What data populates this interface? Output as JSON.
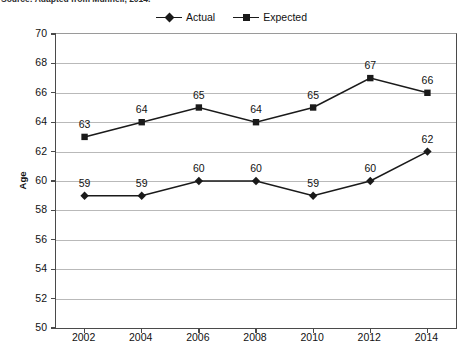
{
  "source_note": "Source: Adapted from Munnell, 2014.",
  "legend": {
    "position": "top-center",
    "entries": [
      {
        "label": "Actual",
        "marker": "diamond-marker-icon",
        "color": "#1a1a1a"
      },
      {
        "label": "Expected",
        "marker": "square-marker-icon",
        "color": "#1a1a1a"
      }
    ]
  },
  "chart_data": {
    "type": "line",
    "title": "",
    "subtitle": "",
    "xlabel": "",
    "ylabel": "Age",
    "categories": [
      "2002",
      "2004",
      "2006",
      "2008",
      "2010",
      "2012",
      "2014"
    ],
    "x": [
      2002,
      2004,
      2006,
      2008,
      2010,
      2012,
      2014
    ],
    "series": [
      {
        "name": "Actual",
        "marker": "diamond",
        "color": "#1a1a1a",
        "values": [
          59,
          59,
          60,
          60,
          59,
          60,
          62
        ],
        "labels": [
          "59",
          "59",
          "60",
          "60",
          "59",
          "60",
          "62"
        ]
      },
      {
        "name": "Expected",
        "marker": "square",
        "color": "#1a1a1a",
        "values": [
          63,
          64,
          65,
          64,
          65,
          67,
          66
        ],
        "labels": [
          "63",
          "64",
          "65",
          "64",
          "65",
          "67",
          "66"
        ]
      }
    ],
    "ylim": [
      50,
      70
    ],
    "ytick_step": 2,
    "yticks": [
      70,
      68,
      66,
      64,
      62,
      60,
      58,
      56,
      54,
      52,
      50
    ],
    "ytick_labels": [
      "70",
      "68",
      "66",
      "64",
      "62",
      "60",
      "58",
      "56",
      "54",
      "52",
      "50"
    ],
    "grid": "horizontal",
    "grid_color": "#b9b9b9",
    "axis_color": "#4a4a4a",
    "plot_background": "#ffffff",
    "data_labels_shown": true
  }
}
